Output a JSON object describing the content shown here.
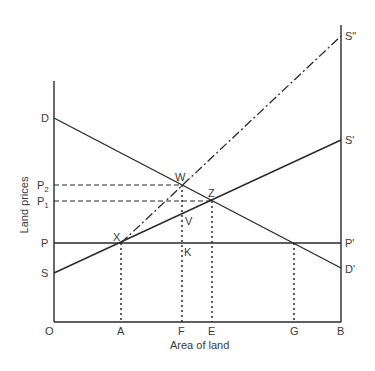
{
  "diagram": {
    "x_axis_title": "Area of land",
    "y_axis_title": "Land prices",
    "origin_label": "O",
    "x_labels": {
      "A": "A",
      "F": "F",
      "E": "E",
      "G": "G",
      "B": "B"
    },
    "y_labels": {
      "D": "D",
      "P2": "P",
      "P2_sub": "2",
      "P1": "P",
      "P1_sub": "1",
      "P": "P",
      "S": "S"
    },
    "right_labels": {
      "S2": "S\"",
      "S1": "S'",
      "P1": "P'",
      "D1": "D'"
    },
    "points": {
      "W": "W",
      "Z": "Z",
      "X": "X",
      "V": "V",
      "K": "K"
    },
    "lines": [
      {
        "name": "demand",
        "from": "D",
        "to": "D'",
        "style": "solid"
      },
      {
        "name": "supply",
        "from": "S",
        "to": "S'",
        "style": "solid"
      },
      {
        "name": "supply-shifted",
        "from": "X",
        "to": "S\"",
        "style": "dash-dot"
      },
      {
        "name": "price-line",
        "from": "P",
        "to": "P'",
        "style": "solid"
      }
    ]
  }
}
